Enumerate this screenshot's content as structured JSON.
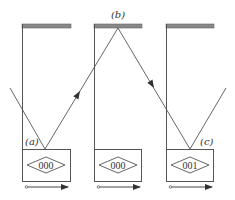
{
  "diagram": {
    "panels": [
      {
        "id": "panel-a",
        "x": 22,
        "counter": "000"
      },
      {
        "id": "panel-b",
        "x": 94,
        "counter": "000"
      },
      {
        "id": "panel-c",
        "x": 166,
        "counter": "001"
      }
    ],
    "labels": {
      "a": "(a)",
      "b": "(b)",
      "c": "(c)"
    },
    "colors": {
      "line": "#555555",
      "mirror": "#888888",
      "mirror_edge": "#666666"
    }
  }
}
